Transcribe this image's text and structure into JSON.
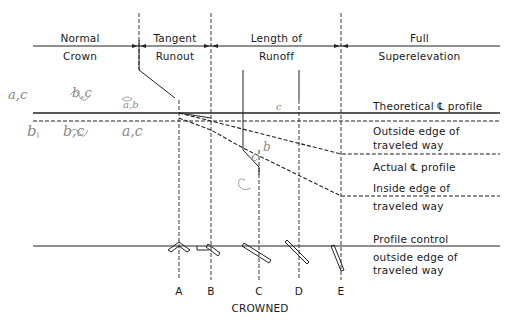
{
  "diagram": {
    "header": {
      "segments": [
        {
          "line1": "Normal",
          "line2": "Crown"
        },
        {
          "line1": "Tangent",
          "line2": "Runout"
        },
        {
          "line1": "Length of",
          "line2": "Runoff"
        },
        {
          "line1": "Full",
          "line2": "Superelevation"
        }
      ]
    },
    "profile_labels": {
      "theoretical_cl": "Theoretical ℄ profile",
      "outside_edge_1": "Outside edge of",
      "outside_edge_2": "traveled way",
      "actual_cl": "Actual ℄ profile",
      "inside_edge_1": "Inside edge of",
      "inside_edge_2": "traveled way",
      "profile_control": "Profile control",
      "control_edge_1": "outside edge of",
      "control_edge_2": "traveled way"
    },
    "sections": {
      "labels": [
        "A",
        "B",
        "C",
        "D",
        "E"
      ],
      "caption": "CROWNED"
    },
    "handwritten_notes": {
      "top_left_1": "a,c",
      "top_left_2": "b,c",
      "top_left_3": "a,b",
      "bottom_left_1": "b",
      "bottom_left_2": "b,c",
      "bottom_left_3": "a,c",
      "mid_c_top": "c",
      "mid_b": "b",
      "mid_c": "c"
    },
    "colors": {
      "line": "#222222",
      "handwriting": "#8a8a8a"
    }
  }
}
